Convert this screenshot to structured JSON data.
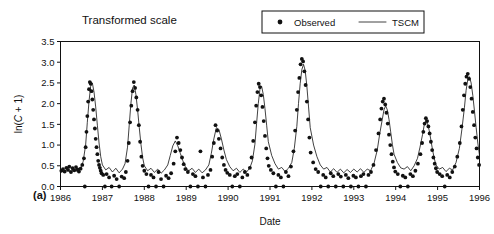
{
  "figure": {
    "panel_label": "(a)",
    "title": "Transformed scale"
  },
  "legend": {
    "position": "top-right",
    "entries": [
      {
        "label": "Observed",
        "marker": "dot",
        "color": "#111111"
      },
      {
        "label": "TSCM",
        "marker": "line",
        "color": "#111111"
      }
    ]
  },
  "chart_data": {
    "type": "line",
    "title": "Transformed scale",
    "xlabel": "Date",
    "ylabel": "ln(C + 1)",
    "ylim": [
      0.0,
      3.5
    ],
    "xlim": [
      1986.0,
      1996.0
    ],
    "grid": false,
    "yticks": [
      "0.0",
      "0.5",
      "1.0",
      "1.5",
      "2.0",
      "2.5",
      "3.0",
      "3.5"
    ],
    "ytick_values": [
      0.0,
      0.5,
      1.0,
      1.5,
      2.0,
      2.5,
      3.0,
      3.5
    ],
    "xticks": [
      "1986",
      "1987",
      "1988",
      "1989",
      "1990",
      "1991",
      "1992",
      "1993",
      "1994",
      "1995",
      "1996"
    ],
    "xtick_values": [
      1986,
      1987,
      1988,
      1989,
      1990,
      1991,
      1992,
      1993,
      1994,
      1995,
      1996
    ],
    "series": [
      {
        "name": "Observed",
        "type": "scatter",
        "marker": "dot",
        "color": "#111111",
        "x": [
          1986.02,
          1986.06,
          1986.1,
          1986.14,
          1986.18,
          1986.21,
          1986.25,
          1986.29,
          1986.33,
          1986.37,
          1986.41,
          1986.44,
          1986.48,
          1986.52,
          1986.56,
          1986.58,
          1986.6,
          1986.62,
          1986.64,
          1986.66,
          1986.68,
          1986.7,
          1986.72,
          1986.74,
          1986.76,
          1986.78,
          1986.8,
          1986.82,
          1986.84,
          1986.86,
          1986.88,
          1986.9,
          1986.92,
          1986.94,
          1986.96,
          1986.98,
          1987.02,
          1987.06,
          1987.1,
          1987.16,
          1987.22,
          1987.28,
          1987.34,
          1987.4,
          1987.46,
          1987.52,
          1987.56,
          1987.6,
          1987.63,
          1987.66,
          1987.69,
          1987.72,
          1987.75,
          1987.78,
          1987.81,
          1987.84,
          1987.87,
          1987.9,
          1987.93,
          1987.96,
          1988.0,
          1988.05,
          1988.1,
          1988.16,
          1988.22,
          1988.28,
          1988.34,
          1988.4,
          1988.46,
          1988.52,
          1988.58,
          1988.64,
          1988.7,
          1988.74,
          1988.78,
          1988.82,
          1988.86,
          1988.9,
          1988.94,
          1988.98,
          1989.04,
          1989.1,
          1989.16,
          1989.22,
          1989.28,
          1989.34,
          1989.4,
          1989.46,
          1989.52,
          1989.58,
          1989.62,
          1989.66,
          1989.7,
          1989.74,
          1989.78,
          1989.82,
          1989.86,
          1989.9,
          1989.94,
          1989.98,
          1990.04,
          1990.1,
          1990.16,
          1990.22,
          1990.28,
          1990.34,
          1990.4,
          1990.46,
          1990.52,
          1990.56,
          1990.6,
          1990.64,
          1990.67,
          1990.7,
          1990.73,
          1990.76,
          1990.79,
          1990.82,
          1990.85,
          1990.88,
          1990.91,
          1990.94,
          1990.97,
          1991.02,
          1991.08,
          1991.14,
          1991.2,
          1991.26,
          1991.32,
          1991.38,
          1991.44,
          1991.5,
          1991.56,
          1991.6,
          1991.64,
          1991.67,
          1991.7,
          1991.73,
          1991.76,
          1991.79,
          1991.82,
          1991.85,
          1991.88,
          1991.91,
          1991.94,
          1991.97,
          1992.03,
          1992.09,
          1992.15,
          1992.21,
          1992.27,
          1992.33,
          1992.39,
          1992.45,
          1992.51,
          1992.57,
          1992.63,
          1992.69,
          1992.75,
          1992.81,
          1992.87,
          1992.93,
          1992.99,
          1993.05,
          1993.11,
          1993.17,
          1993.23,
          1993.29,
          1993.35,
          1993.41,
          1993.47,
          1993.53,
          1993.59,
          1993.63,
          1993.66,
          1993.69,
          1993.72,
          1993.75,
          1993.78,
          1993.81,
          1993.84,
          1993.87,
          1993.9,
          1993.93,
          1993.96,
          1993.99,
          1994.05,
          1994.11,
          1994.17,
          1994.23,
          1994.29,
          1994.35,
          1994.41,
          1994.47,
          1994.53,
          1994.59,
          1994.63,
          1994.66,
          1994.69,
          1994.72,
          1994.75,
          1994.78,
          1994.81,
          1994.84,
          1994.87,
          1994.9,
          1994.93,
          1994.96,
          1994.99,
          1995.05,
          1995.11,
          1995.17,
          1995.23,
          1995.29,
          1995.35,
          1995.41,
          1995.47,
          1995.53,
          1995.57,
          1995.6,
          1995.63,
          1995.66,
          1995.69,
          1995.72,
          1995.75,
          1995.78,
          1995.81,
          1995.84,
          1995.87,
          1995.9,
          1995.93,
          1995.96,
          1995.99
        ],
        "y": [
          0.38,
          0.42,
          0.36,
          0.45,
          0.4,
          0.48,
          0.35,
          0.44,
          0.39,
          0.47,
          0.41,
          0.36,
          0.43,
          0.52,
          0.68,
          0.0,
          0.95,
          1.32,
          1.7,
          2.05,
          2.35,
          2.52,
          2.48,
          2.3,
          2.1,
          1.85,
          1.62,
          1.4,
          1.15,
          0.95,
          0.78,
          0.62,
          0.52,
          0.45,
          0.38,
          0.32,
          0.28,
          0.0,
          0.3,
          0.22,
          0.0,
          0.26,
          0.18,
          0.0,
          0.24,
          0.2,
          0.35,
          0.62,
          1.05,
          1.55,
          1.95,
          2.3,
          2.52,
          2.38,
          2.15,
          1.85,
          1.48,
          1.08,
          0.72,
          0.5,
          0.38,
          0.3,
          0.0,
          0.28,
          0.22,
          0.0,
          0.35,
          0.18,
          0.0,
          0.26,
          0.2,
          0.32,
          0.55,
          0.85,
          1.18,
          1.05,
          0.88,
          0.7,
          0.54,
          0.42,
          0.35,
          0.0,
          0.3,
          0.25,
          0.0,
          0.85,
          0.22,
          0.0,
          0.28,
          0.4,
          0.72,
          1.05,
          1.48,
          1.35,
          1.15,
          0.92,
          0.7,
          0.52,
          0.4,
          0.33,
          0.28,
          0.0,
          0.25,
          0.3,
          0.0,
          0.22,
          0.35,
          0.28,
          0.45,
          0.7,
          1.1,
          1.55,
          1.95,
          2.28,
          2.48,
          2.4,
          2.2,
          1.92,
          1.58,
          1.22,
          0.92,
          0.68,
          0.5,
          0.4,
          0.32,
          0.0,
          0.28,
          0.22,
          0.0,
          0.35,
          0.25,
          0.48,
          0.85,
          1.35,
          1.85,
          2.28,
          2.62,
          2.95,
          3.08,
          3.02,
          2.78,
          2.45,
          2.05,
          1.62,
          1.18,
          0.82,
          0.58,
          0.42,
          0.35,
          0.0,
          0.28,
          0.22,
          0.0,
          0.32,
          0.25,
          0.0,
          0.3,
          0.24,
          0.0,
          0.28,
          0.2,
          0.0,
          0.26,
          0.22,
          0.0,
          0.25,
          0.3,
          0.0,
          0.28,
          0.35,
          0.52,
          0.88,
          1.28,
          1.62,
          1.88,
          2.05,
          2.12,
          1.98,
          1.78,
          1.52,
          1.25,
          1.0,
          0.78,
          0.6,
          0.46,
          0.36,
          0.3,
          0.0,
          0.26,
          0.22,
          0.0,
          0.3,
          0.25,
          0.38,
          0.55,
          0.78,
          1.05,
          1.32,
          1.52,
          1.65,
          1.58,
          1.45,
          1.28,
          1.08,
          0.88,
          0.7,
          0.55,
          0.44,
          0.35,
          0.3,
          0.25,
          0.0,
          0.28,
          0.22,
          0.35,
          0.48,
          0.72,
          1.05,
          1.45,
          1.85,
          2.2,
          2.48,
          2.65,
          2.72,
          2.6,
          2.4,
          2.12,
          1.8,
          1.48,
          1.18,
          0.92,
          0.7,
          0.52
        ]
      },
      {
        "name": "TSCM",
        "type": "line",
        "color": "#111111",
        "x": [
          1986.0,
          1986.08,
          1986.16,
          1986.24,
          1986.32,
          1986.4,
          1986.48,
          1986.54,
          1986.6,
          1986.64,
          1986.68,
          1986.72,
          1986.76,
          1986.8,
          1986.84,
          1986.88,
          1986.92,
          1986.96,
          1987.0,
          1987.08,
          1987.16,
          1987.24,
          1987.32,
          1987.4,
          1987.48,
          1987.54,
          1987.6,
          1987.64,
          1987.68,
          1987.72,
          1987.76,
          1987.8,
          1987.84,
          1987.88,
          1987.92,
          1987.96,
          1988.0,
          1988.08,
          1988.16,
          1988.24,
          1988.32,
          1988.4,
          1988.48,
          1988.56,
          1988.62,
          1988.68,
          1988.74,
          1988.8,
          1988.86,
          1988.92,
          1988.98,
          1989.06,
          1989.14,
          1989.22,
          1989.3,
          1989.38,
          1989.46,
          1989.54,
          1989.6,
          1989.66,
          1989.72,
          1989.78,
          1989.84,
          1989.9,
          1989.96,
          1990.04,
          1990.12,
          1990.2,
          1990.28,
          1990.36,
          1990.44,
          1990.52,
          1990.58,
          1990.64,
          1990.68,
          1990.72,
          1990.76,
          1990.8,
          1990.84,
          1990.88,
          1990.92,
          1990.96,
          1991.04,
          1991.12,
          1991.2,
          1991.28,
          1991.36,
          1991.44,
          1991.52,
          1991.58,
          1991.64,
          1991.68,
          1991.72,
          1991.76,
          1991.8,
          1991.84,
          1991.88,
          1991.92,
          1991.96,
          1992.04,
          1992.12,
          1992.2,
          1992.28,
          1992.36,
          1992.44,
          1992.52,
          1992.6,
          1992.68,
          1992.76,
          1992.84,
          1992.92,
          1993.0,
          1993.08,
          1993.16,
          1993.24,
          1993.32,
          1993.4,
          1993.48,
          1993.56,
          1993.62,
          1993.68,
          1993.72,
          1993.76,
          1993.8,
          1993.84,
          1993.88,
          1993.92,
          1993.96,
          1994.04,
          1994.12,
          1994.2,
          1994.28,
          1994.36,
          1994.44,
          1994.52,
          1994.58,
          1994.64,
          1994.68,
          1994.72,
          1994.76,
          1994.8,
          1994.84,
          1994.88,
          1994.92,
          1994.96,
          1995.04,
          1995.12,
          1995.2,
          1995.28,
          1995.36,
          1995.44,
          1995.52,
          1995.58,
          1995.64,
          1995.68,
          1995.72,
          1995.76,
          1995.8,
          1995.84,
          1995.88,
          1995.92,
          1995.96,
          1996.0
        ],
        "y": [
          0.4,
          0.34,
          0.42,
          0.33,
          0.41,
          0.36,
          0.44,
          0.6,
          1.0,
          1.55,
          2.05,
          2.42,
          2.5,
          2.28,
          1.92,
          1.48,
          1.05,
          0.72,
          0.52,
          0.4,
          0.46,
          0.35,
          0.44,
          0.33,
          0.42,
          0.55,
          0.95,
          1.48,
          2.0,
          2.38,
          2.45,
          2.22,
          1.85,
          1.42,
          1.02,
          0.7,
          0.5,
          0.38,
          0.44,
          0.34,
          0.42,
          0.32,
          0.4,
          0.52,
          0.75,
          0.98,
          1.1,
          0.98,
          0.8,
          0.62,
          0.48,
          0.38,
          0.44,
          0.34,
          0.42,
          0.33,
          0.4,
          0.52,
          0.8,
          1.15,
          1.42,
          1.38,
          1.15,
          0.88,
          0.65,
          0.48,
          0.38,
          0.44,
          0.34,
          0.42,
          0.35,
          0.45,
          0.62,
          1.02,
          1.52,
          2.0,
          2.35,
          2.42,
          2.22,
          1.88,
          1.48,
          1.08,
          0.75,
          0.55,
          0.42,
          0.46,
          0.36,
          0.44,
          0.58,
          0.92,
          1.45,
          2.0,
          2.48,
          2.82,
          2.95,
          2.8,
          2.42,
          1.92,
          1.42,
          1.0,
          0.72,
          0.52,
          0.42,
          0.46,
          0.35,
          0.43,
          0.34,
          0.42,
          0.33,
          0.41,
          0.34,
          0.42,
          0.35,
          0.43,
          0.34,
          0.42,
          0.38,
          0.55,
          0.88,
          1.28,
          1.62,
          1.85,
          1.95,
          1.85,
          1.62,
          1.32,
          1.02,
          0.78,
          0.58,
          0.45,
          0.42,
          0.48,
          0.38,
          0.5,
          0.68,
          0.95,
          1.25,
          1.48,
          1.6,
          1.52,
          1.35,
          1.12,
          0.88,
          0.68,
          0.52,
          0.42,
          0.46,
          0.36,
          0.44,
          0.4,
          0.58,
          0.92,
          1.38,
          1.9,
          2.32,
          2.58,
          2.65,
          2.5,
          2.2,
          1.82,
          1.42,
          1.05,
          0.75
        ]
      }
    ]
  }
}
